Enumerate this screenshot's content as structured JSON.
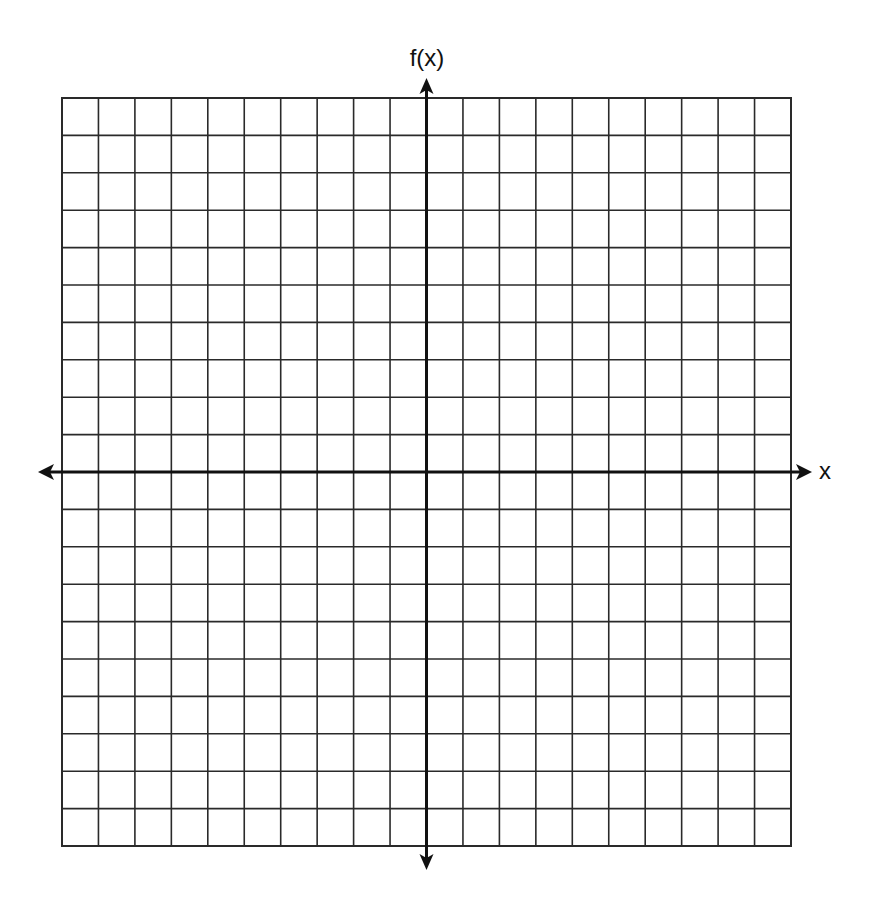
{
  "chart_data": {
    "type": "line",
    "title": "",
    "xlabel": "x",
    "ylabel": "f(x)",
    "grid": true,
    "grid_cells": {
      "columns": 20,
      "rows": 20
    },
    "xlim": [
      -10,
      10
    ],
    "ylim": [
      -10,
      10
    ],
    "series": [],
    "axes": {
      "x_arrows": "both",
      "y_arrows": "both"
    }
  },
  "labels": {
    "y_axis": "f(x)",
    "x_axis": "x"
  },
  "colors": {
    "grid": "#2a2a2a",
    "axis": "#111111",
    "background": "#ffffff"
  }
}
